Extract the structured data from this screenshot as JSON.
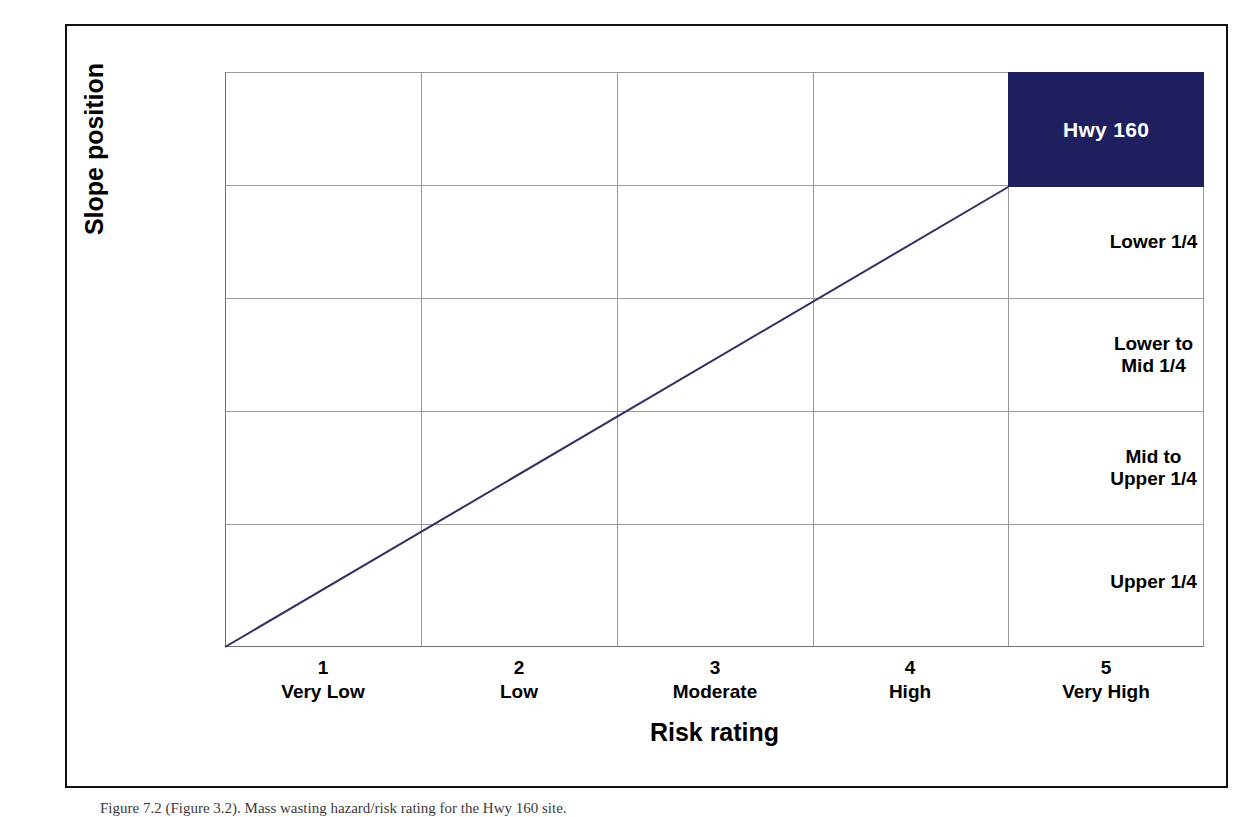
{
  "figure": {
    "caption": "Figure 7.2 (Figure 3.2). Mass wasting hazard/risk rating for the Hwy 160 site.",
    "background_color": "#ffffff",
    "frame_color": "#111111"
  },
  "chart_data": {
    "type": "scatter",
    "title": "",
    "xlabel": "Risk rating",
    "ylabel": "Slope position",
    "grid": true,
    "legend": "none",
    "x_categories": [
      {
        "number": "1",
        "name": "Very Low"
      },
      {
        "number": "2",
        "name": "Low"
      },
      {
        "number": "3",
        "name": "Moderate"
      },
      {
        "number": "4",
        "name": "High"
      },
      {
        "number": "5",
        "name": "Very High"
      }
    ],
    "y_categories": [
      "Stream Adjacent",
      "Lower 1/4",
      "Lower to Mid 1/4",
      "Mid to Upper 1/4",
      "Upper 1/4"
    ],
    "y_tick_lines": [
      [
        "Stream",
        "Adjacent"
      ],
      [
        "Lower 1/4"
      ],
      [
        "Lower to",
        "Mid 1/4"
      ],
      [
        "Mid to",
        "Upper 1/4"
      ],
      [
        "Upper 1/4"
      ]
    ],
    "xlim": [
      0.5,
      5.5
    ],
    "ylim": [
      0.5,
      5.5
    ],
    "series": [
      {
        "name": "Hwy 160",
        "type": "block",
        "label": "Hwy 160",
        "color": "#1e1f5e",
        "text_color": "#ffffff",
        "x_category": "5",
        "x_category_label": "Very High",
        "y_category": "Stream Adjacent",
        "x_range": [
          4.5,
          5.5
        ],
        "y_range": [
          4.5,
          5.5
        ]
      },
      {
        "name": "Risk trend line",
        "type": "line",
        "color": "#2f3064",
        "width": 2,
        "points": [
          {
            "x": 0.5,
            "y": 0.5
          },
          {
            "x": 4.5,
            "y": 4.5
          }
        ]
      }
    ]
  }
}
